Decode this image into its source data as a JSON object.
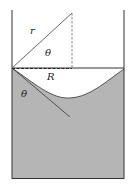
{
  "diagram": {
    "labels": {
      "radius_of_curvature": "r",
      "angle_top": "θ",
      "container_radius": "R",
      "contact_angle": "θ"
    },
    "colors": {
      "liquid_fill": "#b5b5b5",
      "line": "#333333",
      "background": "#ffffff"
    }
  }
}
